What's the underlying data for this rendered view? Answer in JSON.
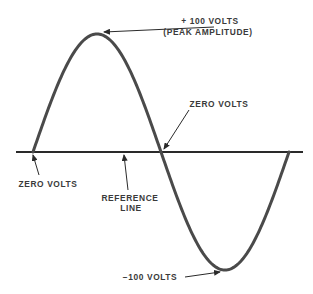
{
  "diagram": {
    "type": "sine-wave",
    "labels": {
      "peak_value": "+ 100 VOLTS",
      "peak_caption": "(PEAK AMPLITUDE)",
      "zero_right": "ZERO VOLTS",
      "zero_left": "ZERO VOLTS",
      "reference_line_1": "REFERENCE",
      "reference_line_2": "LINE",
      "trough_value": "−100 VOLTS"
    },
    "wave": {
      "peak_volts": 100,
      "trough_volts": -100,
      "cycles": 1
    },
    "colors": {
      "curve": "#4a4a4a",
      "line": "#2a2a2a",
      "text": "#3a3a3a"
    }
  }
}
